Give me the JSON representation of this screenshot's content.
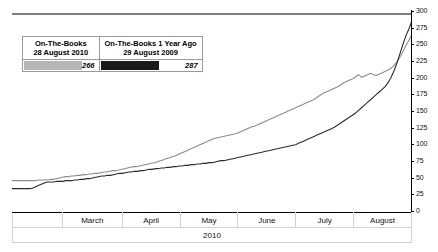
{
  "chart_data": {
    "type": "line",
    "title": "",
    "xlabel": "2010",
    "ylabel": "",
    "ylim": [
      0,
      300
    ],
    "y_ticks": [
      300,
      275,
      250,
      225,
      200,
      175,
      150,
      125,
      100,
      75,
      50,
      25,
      0
    ],
    "grid": false,
    "legend_position": "top-left-inset",
    "x_categories": [
      "",
      "March",
      "April",
      "May",
      "June",
      "July",
      "August"
    ],
    "reference_line": {
      "name": "capacity-line",
      "value": 297,
      "color": "#000000"
    },
    "series": [
      {
        "name": "On-The-Books 28 August 2010",
        "color": "#8c8c8c",
        "final_value": 266,
        "values": [
          47,
          47,
          47,
          47,
          47,
          47,
          47,
          47,
          47,
          48,
          48,
          48,
          48,
          49,
          49,
          50,
          51,
          52,
          53,
          53,
          54,
          54,
          55,
          55,
          56,
          56,
          57,
          57,
          58,
          58,
          59,
          60,
          60,
          61,
          62,
          62,
          63,
          64,
          65,
          66,
          67,
          68,
          68,
          69,
          70,
          71,
          72,
          73,
          74,
          75,
          77,
          78,
          80,
          81,
          83,
          84,
          86,
          88,
          90,
          92,
          94,
          96,
          98,
          100,
          102,
          104,
          106,
          108,
          110,
          111,
          112,
          113,
          114,
          115,
          116,
          117,
          118,
          120,
          122,
          124,
          126,
          128,
          129,
          131,
          133,
          135,
          137,
          139,
          141,
          143,
          145,
          147,
          149,
          151,
          153,
          155,
          157,
          159,
          161,
          163,
          165,
          167,
          169,
          172,
          175,
          178,
          180,
          182,
          184,
          186,
          188,
          191,
          194,
          196,
          198,
          200,
          203,
          206,
          202,
          204,
          206,
          208,
          206,
          205,
          207,
          209,
          211,
          213,
          216,
          220,
          226,
          233,
          241,
          250,
          258,
          266
        ]
      },
      {
        "name": "On-The-Books 1 Year Ago 29 August 2009",
        "color": "#2b2b2b",
        "final_value": 287,
        "values": [
          35,
          35,
          35,
          35,
          35,
          35,
          35,
          36,
          38,
          40,
          42,
          44,
          45,
          45,
          45,
          46,
          46,
          46,
          47,
          47,
          47,
          48,
          48,
          49,
          49,
          50,
          50,
          51,
          52,
          53,
          54,
          54,
          55,
          55,
          56,
          57,
          58,
          58,
          59,
          60,
          60,
          61,
          61,
          62,
          62,
          63,
          64,
          64,
          65,
          65,
          66,
          66,
          67,
          67,
          68,
          68,
          69,
          69,
          70,
          70,
          71,
          71,
          72,
          72,
          73,
          73,
          74,
          74,
          75,
          76,
          77,
          77,
          78,
          79,
          80,
          81,
          82,
          83,
          84,
          85,
          86,
          87,
          88,
          89,
          90,
          91,
          92,
          93,
          94,
          95,
          96,
          97,
          98,
          99,
          100,
          101,
          103,
          105,
          107,
          109,
          111,
          113,
          115,
          117,
          119,
          121,
          123,
          125,
          127,
          130,
          133,
          136,
          139,
          142,
          145,
          148,
          152,
          156,
          160,
          164,
          168,
          172,
          176,
          180,
          184,
          188,
          194,
          202,
          212,
          224,
          238,
          252,
          265,
          275,
          287
        ]
      }
    ]
  },
  "legend": {
    "columns": [
      {
        "title_line1": "On-The-Books",
        "title_line2": "28 August 2010",
        "value": "266",
        "swatch_color": "#b5b5b5",
        "swatch_width": 58
      },
      {
        "title_line1": "On-The-Books 1 Year Ago",
        "title_line2": "29 August 2009",
        "value": "287",
        "swatch_color": "#1a1a1a",
        "swatch_width": 58
      }
    ]
  },
  "x_axis": {
    "months": [
      "",
      "March",
      "April",
      "May",
      "June",
      "July",
      "August"
    ],
    "year": "2010"
  },
  "y_axis": {
    "ticks": [
      "300",
      "275",
      "250",
      "225",
      "200",
      "175",
      "150",
      "125",
      "100",
      "75",
      "50",
      "25",
      "0"
    ]
  }
}
